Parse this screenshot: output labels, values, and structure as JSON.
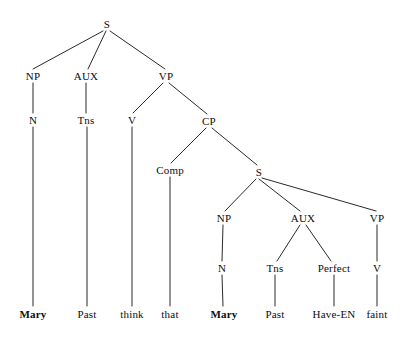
{
  "figure": {
    "sentence": "Mary Past think that Mary Past Have-EN faint",
    "background_color": "#ffffff",
    "line_color": "#111111",
    "text_color": "#0d0d0d"
  },
  "nodes": [
    {
      "id": "s-root",
      "label": "S",
      "x": 107,
      "y": 24,
      "bold": false,
      "terminal": false
    },
    {
      "id": "np-matrix",
      "label": "NP",
      "x": 33,
      "y": 76,
      "bold": false,
      "terminal": false
    },
    {
      "id": "aux-matrix",
      "label": "AUX",
      "x": 86,
      "y": 76,
      "bold": false,
      "terminal": false
    },
    {
      "id": "vp-matrix",
      "label": "VP",
      "x": 166,
      "y": 76,
      "bold": false,
      "terminal": false
    },
    {
      "id": "n-matrix",
      "label": "N",
      "x": 33,
      "y": 120,
      "bold": false,
      "terminal": false
    },
    {
      "id": "tns-matrix",
      "label": "Tns",
      "x": 86,
      "y": 120,
      "bold": false,
      "terminal": false
    },
    {
      "id": "v-matrix",
      "label": "V",
      "x": 132,
      "y": 120,
      "bold": false,
      "terminal": false
    },
    {
      "id": "cp",
      "label": "CP",
      "x": 209,
      "y": 121,
      "bold": false,
      "terminal": false
    },
    {
      "id": "comp",
      "label": "Comp",
      "x": 170,
      "y": 170,
      "bold": false,
      "terminal": false
    },
    {
      "id": "s-embedded",
      "label": "S",
      "x": 259,
      "y": 172,
      "bold": false,
      "terminal": false
    },
    {
      "id": "np-embedded",
      "label": "NP",
      "x": 224,
      "y": 218,
      "bold": false,
      "terminal": false
    },
    {
      "id": "aux-embedded",
      "label": "AUX",
      "x": 303,
      "y": 218,
      "bold": false,
      "terminal": false
    },
    {
      "id": "vp-embedded",
      "label": "VP",
      "x": 377,
      "y": 218,
      "bold": false,
      "terminal": false
    },
    {
      "id": "n-embedded",
      "label": "N",
      "x": 222,
      "y": 268,
      "bold": false,
      "terminal": false
    },
    {
      "id": "tns-embedded",
      "label": "Tns",
      "x": 275,
      "y": 268,
      "bold": false,
      "terminal": false
    },
    {
      "id": "perfect",
      "label": "Perfect",
      "x": 334,
      "y": 268,
      "bold": false,
      "terminal": false
    },
    {
      "id": "v-embedded",
      "label": "V",
      "x": 377,
      "y": 268,
      "bold": false,
      "terminal": false
    },
    {
      "id": "word-mary-1",
      "label": "Mary",
      "x": 33,
      "y": 314,
      "bold": true,
      "terminal": true
    },
    {
      "id": "word-past-1",
      "label": "Past",
      "x": 87,
      "y": 314,
      "bold": false,
      "terminal": true
    },
    {
      "id": "word-think",
      "label": "think",
      "x": 132,
      "y": 314,
      "bold": false,
      "terminal": true
    },
    {
      "id": "word-that",
      "label": "that",
      "x": 170,
      "y": 314,
      "bold": false,
      "terminal": true
    },
    {
      "id": "word-mary-2",
      "label": "Mary",
      "x": 224,
      "y": 314,
      "bold": true,
      "terminal": true
    },
    {
      "id": "word-past-2",
      "label": "Past",
      "x": 275,
      "y": 314,
      "bold": false,
      "terminal": true
    },
    {
      "id": "word-have-en",
      "label": "Have-EN",
      "x": 334,
      "y": 314,
      "bold": false,
      "terminal": true
    },
    {
      "id": "word-faint",
      "label": "faint",
      "x": 377,
      "y": 314,
      "bold": false,
      "terminal": true
    }
  ],
  "edges": [
    {
      "from": "s-root",
      "to": "np-matrix",
      "x1": 103,
      "y1": 31,
      "x2": 33,
      "y2": 69
    },
    {
      "from": "s-root",
      "to": "aux-matrix",
      "x1": 106,
      "y1": 31,
      "x2": 88,
      "y2": 69
    },
    {
      "from": "s-root",
      "to": "vp-matrix",
      "x1": 110,
      "y1": 31,
      "x2": 165,
      "y2": 69
    },
    {
      "from": "np-matrix",
      "to": "n-matrix",
      "x1": 33,
      "y1": 83,
      "x2": 33,
      "y2": 113
    },
    {
      "from": "aux-matrix",
      "to": "tns-matrix",
      "x1": 86,
      "y1": 83,
      "x2": 86,
      "y2": 113
    },
    {
      "from": "vp-matrix",
      "to": "v-matrix",
      "x1": 163,
      "y1": 83,
      "x2": 133,
      "y2": 113
    },
    {
      "from": "vp-matrix",
      "to": "cp",
      "x1": 169,
      "y1": 83,
      "x2": 207,
      "y2": 114
    },
    {
      "from": "n-matrix",
      "to": "word-mary-1",
      "x1": 33,
      "y1": 127,
      "x2": 33,
      "y2": 306
    },
    {
      "from": "tns-matrix",
      "to": "word-past-1",
      "x1": 87,
      "y1": 127,
      "x2": 87,
      "y2": 306
    },
    {
      "from": "v-matrix",
      "to": "word-think",
      "x1": 132,
      "y1": 127,
      "x2": 132,
      "y2": 306
    },
    {
      "from": "cp",
      "to": "comp",
      "x1": 206,
      "y1": 128,
      "x2": 171,
      "y2": 163
    },
    {
      "from": "cp",
      "to": "s-embedded",
      "x1": 212,
      "y1": 128,
      "x2": 257,
      "y2": 165
    },
    {
      "from": "comp",
      "to": "word-that",
      "x1": 170,
      "y1": 177,
      "x2": 170,
      "y2": 306
    },
    {
      "from": "s-embedded",
      "to": "np-embedded",
      "x1": 256,
      "y1": 179,
      "x2": 225,
      "y2": 211
    },
    {
      "from": "s-embedded",
      "to": "aux-embedded",
      "x1": 259,
      "y1": 179,
      "x2": 300,
      "y2": 211
    },
    {
      "from": "s-embedded",
      "to": "vp-embedded",
      "x1": 262,
      "y1": 178,
      "x2": 376,
      "y2": 211
    },
    {
      "from": "np-embedded",
      "to": "n-embedded",
      "x1": 223,
      "y1": 225,
      "x2": 222,
      "y2": 261
    },
    {
      "from": "aux-embedded",
      "to": "tns-embedded",
      "x1": 300,
      "y1": 225,
      "x2": 277,
      "y2": 261
    },
    {
      "from": "aux-embedded",
      "to": "perfect",
      "x1": 306,
      "y1": 225,
      "x2": 331,
      "y2": 261
    },
    {
      "from": "vp-embedded",
      "to": "v-embedded",
      "x1": 377,
      "y1": 225,
      "x2": 377,
      "y2": 261
    },
    {
      "from": "n-embedded",
      "to": "word-mary-2",
      "x1": 222,
      "y1": 275,
      "x2": 223,
      "y2": 306
    },
    {
      "from": "tns-embedded",
      "to": "word-past-2",
      "x1": 275,
      "y1": 275,
      "x2": 275,
      "y2": 306
    },
    {
      "from": "perfect",
      "to": "word-have-en",
      "x1": 334,
      "y1": 275,
      "x2": 334,
      "y2": 306
    },
    {
      "from": "v-embedded",
      "to": "word-faint",
      "x1": 377,
      "y1": 275,
      "x2": 377,
      "y2": 306
    }
  ]
}
